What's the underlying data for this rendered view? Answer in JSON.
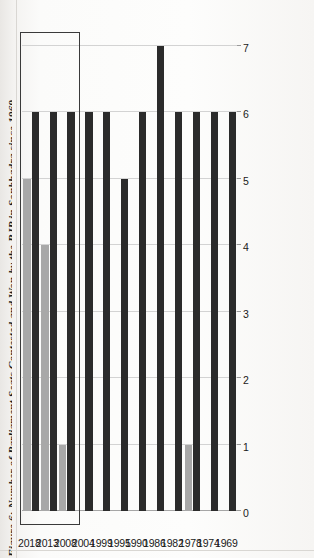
{
  "figure": {
    "title": "Figure 6: Number of Parliament Seats Contested and Won by the BJP in Sonbhadra since 1969",
    "orientation": "rotated-90",
    "colors": {
      "contested": "#2b2b2b",
      "won": "#a8a8a8",
      "gridline": "#d3d3d3",
      "inset_border": "#3a3a3a"
    }
  },
  "legend": {
    "items": [
      {
        "label": "Contested",
        "color": "#2b2b2b"
      },
      {
        "label": "Won",
        "color": "#a8a8a8"
      }
    ]
  },
  "axis": {
    "tick_labels": [
      "7",
      "6",
      "5",
      "4",
      "3",
      "2",
      "1",
      "0"
    ],
    "min": 0,
    "max": 7
  },
  "inset": {
    "note": "highlight box around 2008, 2013, 2018",
    "categories": [
      "2008",
      "2013",
      "2018"
    ]
  },
  "chart_data": {
    "type": "bar",
    "title": "Figure 6: Number of Parliament Seats Contested and Won by the BJP in Sonbhadra since 1969",
    "xlabel": "",
    "ylabel": "",
    "categories": [
      "1969",
      "1974",
      "1978",
      "1982",
      "1986",
      "1990",
      "1995",
      "1999",
      "2004",
      "2008",
      "2013",
      "2018"
    ],
    "series": [
      {
        "name": "Contested",
        "color": "#2b2b2b",
        "values": [
          6,
          6,
          6,
          6,
          7,
          6,
          5,
          6,
          6,
          6,
          6,
          6
        ]
      },
      {
        "name": "Won",
        "color": "#a8a8a8",
        "values": [
          0,
          0,
          1,
          0,
          0,
          0,
          0,
          0,
          0,
          1,
          4,
          5
        ]
      }
    ],
    "ylim": [
      0,
      7
    ],
    "grid": true,
    "legend_position": "bottom"
  }
}
